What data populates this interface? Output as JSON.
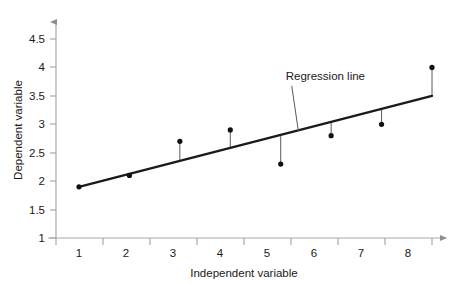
{
  "chart_data": {
    "type": "scatter",
    "title": "",
    "xlabel": "Independent variable",
    "ylabel": "Dependent variable",
    "x": [
      1,
      2,
      3,
      4,
      5,
      6,
      7,
      8
    ],
    "values": [
      1.9,
      2.1,
      2.7,
      2.9,
      2.3,
      2.8,
      3.0,
      4.0
    ],
    "series": [
      {
        "name": "Observations",
        "x": [
          1,
          2,
          3,
          4,
          5,
          6,
          7,
          8
        ],
        "values": [
          1.9,
          2.1,
          2.7,
          2.9,
          2.3,
          2.8,
          3.0,
          4.0
        ]
      },
      {
        "name": "Regression line",
        "type": "line",
        "x": [
          1,
          8
        ],
        "values": [
          1.9,
          3.5
        ]
      }
    ],
    "residuals": [
      {
        "x": 1,
        "y_observed": 1.9,
        "y_fitted": 1.9
      },
      {
        "x": 2,
        "y_observed": 2.1,
        "y_fitted": 2.13
      },
      {
        "x": 3,
        "y_observed": 2.7,
        "y_fitted": 2.36
      },
      {
        "x": 4,
        "y_observed": 2.9,
        "y_fitted": 2.59
      },
      {
        "x": 5,
        "y_observed": 2.3,
        "y_fitted": 2.81
      },
      {
        "x": 6,
        "y_observed": 2.8,
        "y_fitted": 3.04
      },
      {
        "x": 7,
        "y_observed": 3.0,
        "y_fitted": 3.27
      },
      {
        "x": 8,
        "y_observed": 4.0,
        "y_fitted": 3.5
      }
    ],
    "xticklabels": [
      "1",
      "2",
      "3",
      "4",
      "5",
      "6",
      "7",
      "8"
    ],
    "yticklabels": [
      "1",
      "1.5",
      "2",
      "2.5",
      "3",
      "3.5",
      "4",
      "4.5"
    ],
    "yticks": [
      1,
      1.5,
      2,
      2.5,
      3,
      3.5,
      4,
      4.5
    ],
    "xlim": [
      0.5,
      8.7
    ],
    "ylim": [
      1,
      4.75
    ],
    "grid": false,
    "legend": "none",
    "annotations": [
      {
        "text": "Regression line",
        "x": 5.1,
        "y": 3.78,
        "leader_to_x": 5.35,
        "leader_to_y": 2.88
      }
    ]
  },
  "style": {
    "axis_color": "#a9a9ad",
    "line_color": "#1a1a1a",
    "point_color": "#111111",
    "residual_color": "#5a5a5a",
    "annotation_color": "#1a1a1a",
    "background": "#ffffff"
  },
  "axis_label_names": {
    "x": "x-axis-title",
    "y": "y-axis-title"
  }
}
